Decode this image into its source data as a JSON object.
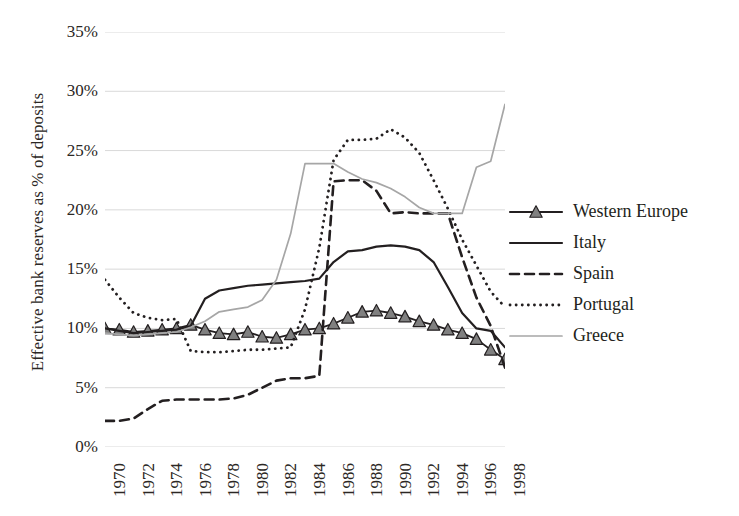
{
  "chart_data": {
    "type": "line",
    "title": "",
    "xlabel": "",
    "ylabel": "Effective bank reserves as % of deposits",
    "ylim": [
      0,
      35
    ],
    "ytick_labels": [
      "0%",
      "5%",
      "10%",
      "15%",
      "20%",
      "25%",
      "30%",
      "35%"
    ],
    "ytick_values": [
      0,
      5,
      10,
      15,
      20,
      25,
      30,
      35
    ],
    "xlim": [
      1970,
      1998
    ],
    "xtick_labels": [
      "1970",
      "1972",
      "1974",
      "1976",
      "1978",
      "1980",
      "1982",
      "1984",
      "1986",
      "1988",
      "1990",
      "1992",
      "1994",
      "1996",
      "1998"
    ],
    "xtick_values": [
      1970,
      1972,
      1974,
      1976,
      1978,
      1980,
      1982,
      1984,
      1986,
      1988,
      1990,
      1992,
      1994,
      1996,
      1998
    ],
    "x": [
      1970,
      1971,
      1972,
      1973,
      1974,
      1975,
      1976,
      1977,
      1978,
      1979,
      1980,
      1981,
      1982,
      1983,
      1984,
      1985,
      1986,
      1987,
      1988,
      1989,
      1990,
      1991,
      1992,
      1993,
      1994,
      1995,
      1996,
      1997,
      1998
    ],
    "grid": "horizontal",
    "legend_position": "right",
    "series": [
      {
        "name": "Western Europe",
        "style": "solid-marker",
        "marker": "triangle",
        "color": "#231f20",
        "values": [
          10.0,
          9.9,
          9.7,
          9.8,
          9.9,
          10.0,
          10.3,
          9.9,
          9.6,
          9.5,
          9.7,
          9.3,
          9.2,
          9.5,
          9.9,
          10.0,
          10.4,
          10.9,
          11.4,
          11.5,
          11.3,
          11.0,
          10.6,
          10.3,
          9.9,
          9.6,
          9.1,
          8.2,
          7.4
        ]
      },
      {
        "name": "Italy",
        "style": "solid",
        "color": "#231f20",
        "values": [
          10.0,
          9.8,
          9.6,
          9.7,
          9.8,
          9.9,
          10.2,
          12.5,
          13.2,
          13.4,
          13.6,
          13.7,
          13.8,
          13.9,
          14.0,
          14.2,
          15.6,
          16.5,
          16.6,
          16.9,
          17.0,
          16.9,
          16.6,
          15.6,
          13.5,
          11.3,
          10.0,
          9.8,
          8.4
        ]
      },
      {
        "name": "Spain",
        "style": "dashed",
        "color": "#231f20",
        "values": [
          2.2,
          2.2,
          2.4,
          3.2,
          3.9,
          4.0,
          4.0,
          4.0,
          4.0,
          4.1,
          4.4,
          5.0,
          5.6,
          5.8,
          5.8,
          6.0,
          22.4,
          22.5,
          22.5,
          21.6,
          19.7,
          19.8,
          19.7,
          19.7,
          19.7,
          16.0,
          12.6,
          10.2,
          6.7
        ]
      },
      {
        "name": "Portugal",
        "style": "dotted",
        "color": "#231f20",
        "values": [
          14.1,
          12.6,
          11.3,
          10.9,
          10.7,
          10.8,
          8.1,
          8.0,
          8.0,
          8.1,
          8.2,
          8.2,
          8.3,
          8.4,
          11.6,
          16.8,
          24.2,
          25.9,
          25.9,
          26.0,
          26.8,
          26.1,
          24.8,
          22.5,
          20.1,
          17.5,
          15.3,
          13.1,
          11.8
        ]
      },
      {
        "name": "Greece",
        "style": "solid-light",
        "color": "#a6a6a6",
        "values": [
          9.6,
          9.5,
          9.4,
          9.5,
          9.6,
          9.7,
          10.1,
          10.6,
          11.4,
          11.6,
          11.8,
          12.4,
          14.1,
          18.0,
          23.9,
          23.9,
          23.9,
          23.2,
          22.6,
          22.3,
          21.8,
          21.1,
          20.2,
          19.7,
          19.7,
          19.7,
          23.6,
          24.1,
          28.9
        ]
      }
    ]
  },
  "legend": {
    "items": [
      {
        "label": "Western Europe",
        "key": "solid-marker"
      },
      {
        "label": "Italy",
        "key": "solid"
      },
      {
        "label": "Spain",
        "key": "dashed"
      },
      {
        "label": "Portugal",
        "key": "dotted"
      },
      {
        "label": "Greece",
        "key": "solid-light"
      }
    ]
  },
  "colors": {
    "ink": "#231f20",
    "grid": "#d9d9d9",
    "greece": "#a6a6a6",
    "marker_fill": "#808080",
    "background": "#ffffff"
  }
}
